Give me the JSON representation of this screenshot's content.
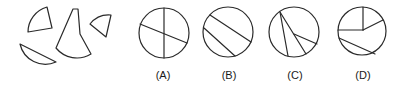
{
  "figure": {
    "pieces_count": 4,
    "options": [
      {
        "id": "A",
        "label": "(A)",
        "cx": 164,
        "cy": 33,
        "r": 25
      },
      {
        "id": "B",
        "label": "(B)",
        "cx": 228,
        "cy": 32,
        "r": 25
      },
      {
        "id": "C",
        "label": "(C)",
        "cx": 294,
        "cy": 32,
        "r": 25
      },
      {
        "id": "D",
        "label": "(D)",
        "cx": 362,
        "cy": 31,
        "r": 24
      }
    ],
    "stroke_color": "#2a2a2a",
    "background": "#ffffff"
  }
}
